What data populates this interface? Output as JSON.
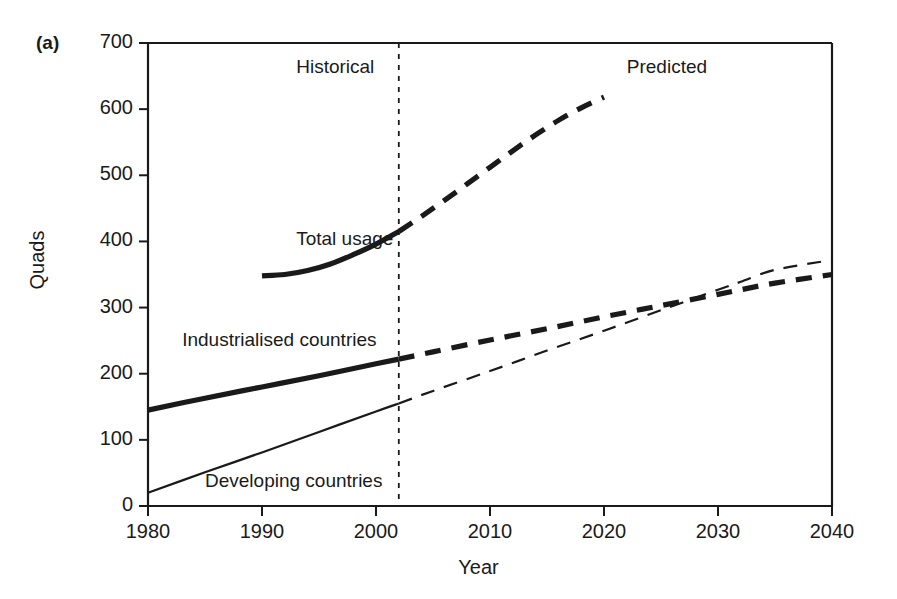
{
  "figure": {
    "panel_label": "(a)",
    "background_color": "#ffffff",
    "ink_color": "#1a1a1a"
  },
  "chart_data": {
    "type": "line",
    "title": "",
    "subtitle": "",
    "xlabel": "Year",
    "ylabel": "Quads",
    "xlim": [
      1980,
      2040
    ],
    "ylim": [
      0,
      700
    ],
    "xticks": [
      1980,
      1990,
      2000,
      2010,
      2020,
      2030,
      2040
    ],
    "xtick_labels": [
      "1980",
      "1990",
      "2000",
      "2010",
      "2020",
      "2030",
      "2040"
    ],
    "yticks": [
      0,
      100,
      200,
      300,
      400,
      500,
      600,
      700
    ],
    "ytick_labels": [
      "0",
      "100",
      "200",
      "300",
      "400",
      "500",
      "600",
      "700"
    ],
    "grid": false,
    "legend_position": "inline-annotations",
    "divider": {
      "x": 2002,
      "style": "dashed-vertical",
      "left_label": "Historical",
      "right_label": "Predicted"
    },
    "annotations": [
      {
        "text": "Historical",
        "x": 1993,
        "y": 660
      },
      {
        "text": "Predicted",
        "x": 2022,
        "y": 660
      },
      {
        "text": "Total usage",
        "x": 1993,
        "y": 400
      },
      {
        "text": "Industrialised countries",
        "x": 1983,
        "y": 248
      },
      {
        "text": "Developing countries",
        "x": 1985,
        "y": 35
      }
    ],
    "series": [
      {
        "name": "Total usage",
        "line_weight": "thick",
        "historical_style": "solid",
        "predicted_style": "dashed",
        "x": [
          1990,
          1992,
          1994,
          1996,
          1998,
          2000,
          2002,
          2004,
          2006,
          2008,
          2010,
          2012,
          2014,
          2016,
          2018,
          2020
        ],
        "values": [
          348,
          350,
          356,
          366,
          380,
          396,
          415,
          438,
          462,
          487,
          512,
          537,
          561,
          583,
          602,
          618
        ]
      },
      {
        "name": "Industrialised countries",
        "line_weight": "thick",
        "historical_style": "solid",
        "predicted_style": "dashed",
        "x": [
          1980,
          1985,
          1990,
          1995,
          2000,
          2002,
          2005,
          2010,
          2015,
          2020,
          2025,
          2030,
          2032,
          2035,
          2040
        ],
        "values": [
          145,
          163,
          180,
          197,
          215,
          222,
          233,
          251,
          268,
          286,
          303,
          320,
          327,
          337,
          350
        ]
      },
      {
        "name": "Developing countries",
        "line_weight": "thin",
        "historical_style": "solid",
        "predicted_style": "dashed",
        "x": [
          1980,
          1985,
          1990,
          1995,
          2000,
          2002,
          2005,
          2010,
          2015,
          2020,
          2025,
          2030,
          2032,
          2035,
          2040
        ],
        "values": [
          20,
          51,
          81,
          112,
          143,
          155,
          174,
          204,
          235,
          265,
          296,
          327,
          339,
          357,
          372
        ]
      }
    ]
  },
  "axes_geometry": {
    "left_px": 148,
    "right_px": 832,
    "bottom_px": 506,
    "top_px": 43
  }
}
